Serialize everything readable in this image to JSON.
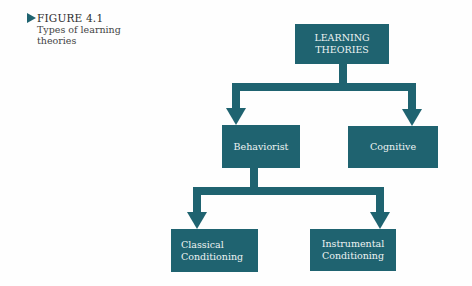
{
  "caption": {
    "figure_label": "FIGURE 4.1",
    "title": "Types of learning theories"
  },
  "diagram": {
    "root": {
      "label_line1": "LEARNING",
      "label_line2": "THEORIES"
    },
    "level1": [
      {
        "label": "Behaviorist"
      },
      {
        "label": "Cognitive"
      }
    ],
    "level2": [
      {
        "label_line1": "Classical",
        "label_line2": "Conditioning"
      },
      {
        "label_line1": "Instrumental",
        "label_line2": "Conditioning"
      }
    ],
    "colors": {
      "box": "#1f6370",
      "text": "#eef3f3"
    }
  }
}
